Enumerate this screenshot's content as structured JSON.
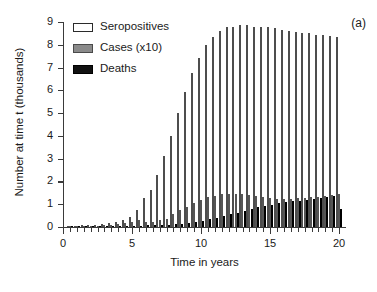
{
  "panel": {
    "tag": "(a)"
  },
  "axes": {
    "xlabel": "Time in years",
    "ylabel": "Number at time t (thousands)",
    "x_major_ticks": [
      0,
      5,
      10,
      15,
      20
    ],
    "x_tick_labels": [
      "0",
      "5",
      "10",
      "15",
      "20"
    ],
    "y_ticks": [
      0,
      1,
      2,
      3,
      4,
      5,
      6,
      7,
      8,
      9
    ],
    "y_tick_labels": [
      "0",
      "1",
      "2",
      "3",
      "4",
      "5",
      "6",
      "7",
      "8",
      "9"
    ]
  },
  "legend": {
    "position": "top-left-inside",
    "entries": [
      {
        "label": "Seropositives",
        "swatch": "white-outline",
        "color": "#ffffff"
      },
      {
        "label": "Cases (x10)",
        "swatch": "gray-fill",
        "color": "#8a8a8a"
      },
      {
        "label": "Deaths",
        "swatch": "black-fill",
        "color": "#111111"
      }
    ]
  },
  "chart_data": {
    "type": "bar",
    "title": "",
    "xlabel": "Time in years",
    "ylabel": "Number at time t (thousands)",
    "xlim": [
      0,
      20.5
    ],
    "ylim": [
      0,
      9
    ],
    "grid": false,
    "legend_position": "upper left",
    "x": [
      0.5,
      1.0,
      1.5,
      2.0,
      2.5,
      3.0,
      3.5,
      4.0,
      4.5,
      5.0,
      5.5,
      6.0,
      6.5,
      7.0,
      7.5,
      8.0,
      8.5,
      9.0,
      9.5,
      10.0,
      10.5,
      11.0,
      11.5,
      12.0,
      12.5,
      13.0,
      13.5,
      14.0,
      14.5,
      15.0,
      15.5,
      16.0,
      16.5,
      17.0,
      17.5,
      18.0,
      18.5,
      19.0,
      19.5,
      20.0
    ],
    "series": [
      {
        "name": "Seropositives",
        "color": "#ffffff",
        "values": [
          0.04,
          0.05,
          0.07,
          0.09,
          0.11,
          0.14,
          0.18,
          0.23,
          0.3,
          0.43,
          0.76,
          1.29,
          1.62,
          2.3,
          3.1,
          3.99,
          4.99,
          5.92,
          6.74,
          7.41,
          7.97,
          8.34,
          8.59,
          8.76,
          8.78,
          8.87,
          8.85,
          8.8,
          8.77,
          8.78,
          8.74,
          8.65,
          8.62,
          8.58,
          8.5,
          8.51,
          8.45,
          8.41,
          8.38,
          8.33
        ]
      },
      {
        "name": "Cases (x10)",
        "color": "#8a8a8a",
        "values": [
          0.02,
          0.03,
          0.04,
          0.05,
          0.06,
          0.08,
          0.1,
          0.13,
          0.17,
          0.22,
          0.29,
          0.21,
          0.24,
          0.29,
          0.34,
          0.55,
          0.74,
          0.89,
          1.04,
          1.17,
          1.3,
          1.37,
          1.45,
          1.47,
          1.46,
          1.46,
          1.42,
          1.37,
          1.33,
          1.29,
          1.25,
          1.22,
          1.23,
          1.27,
          1.28,
          1.3,
          1.33,
          1.37,
          1.42,
          1.46
        ]
      },
      {
        "name": "Deaths",
        "color": "#111111",
        "values": [
          0.005,
          0.007,
          0.01,
          0.012,
          0.015,
          0.02,
          0.025,
          0.03,
          0.04,
          0.05,
          0.06,
          0.07,
          0.08,
          0.09,
          0.1,
          0.12,
          0.14,
          0.18,
          0.23,
          0.28,
          0.33,
          0.4,
          0.47,
          0.55,
          0.62,
          0.7,
          0.78,
          0.86,
          0.91,
          0.97,
          1.04,
          1.11,
          1.14,
          1.16,
          1.2,
          1.24,
          1.27,
          1.31,
          1.36,
          0.78
        ]
      }
    ]
  }
}
